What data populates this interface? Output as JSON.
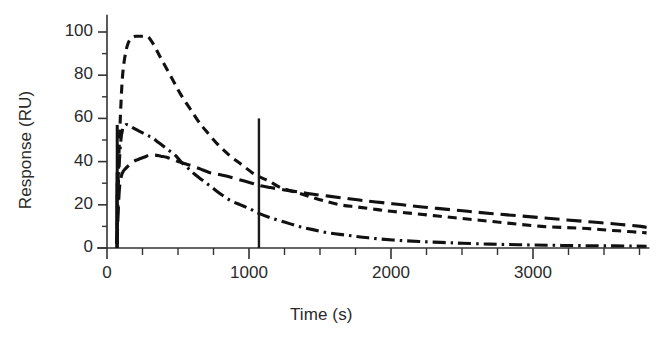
{
  "chart_data": {
    "type": "line",
    "title": "",
    "subtitle": "",
    "xlabel": "Time (s)",
    "ylabel": "Response (RU)",
    "xlim": [
      -60,
      3820
    ],
    "ylim": [
      -4,
      108
    ],
    "xticks": [
      0,
      1000,
      2000,
      3000
    ],
    "xtick_labels": [
      "0",
      "1000",
      "2000",
      "3000"
    ],
    "x_minor_tick_interval": 250,
    "yticks": [
      0,
      20,
      40,
      60,
      80,
      100
    ],
    "ytick_labels": [
      "0",
      "20",
      "40",
      "60",
      "80",
      "100"
    ],
    "y_minor_tick_interval": 10,
    "grid": false,
    "legend": "none",
    "axis_color": "#333333",
    "series": [
      {
        "name": "curve-high",
        "style": "dashed",
        "color": "#111111",
        "peak_value": 98,
        "x": [
          70,
          80,
          95,
          110,
          130,
          150,
          170,
          200,
          240,
          280,
          300,
          330,
          370,
          420,
          470,
          520,
          580,
          640,
          700,
          780,
          860,
          940,
          1020,
          1070,
          1140,
          1220,
          1320,
          1420,
          1520,
          1640,
          1760,
          1880,
          2000,
          2150,
          2300,
          2450,
          2600,
          2750,
          2900,
          3060,
          3220,
          3380,
          3540,
          3700,
          3800
        ],
        "y": [
          2,
          35,
          62,
          80,
          90,
          95,
          97,
          98,
          98,
          98,
          97,
          94,
          89,
          83,
          77,
          71,
          65,
          59,
          54,
          48,
          43,
          39,
          35,
          33,
          31,
          28,
          26,
          24,
          22,
          20,
          19,
          18,
          17,
          16,
          15,
          14,
          13,
          12,
          11,
          10,
          9.5,
          9,
          8.2,
          7.5,
          7
        ]
      },
      {
        "name": "curve-mid",
        "style": "dashdot",
        "color": "#111111",
        "peak_value": 57,
        "x": [
          70,
          80,
          95,
          110,
          130,
          150,
          175,
          200,
          230,
          260,
          290,
          320,
          360,
          400,
          440,
          480,
          520,
          570,
          620,
          680,
          740,
          800,
          870,
          940,
          1010,
          1070,
          1150,
          1250,
          1350,
          1450,
          1560,
          1680,
          1800,
          1920,
          2060,
          2200,
          2350,
          2500,
          2700,
          2900,
          3100,
          3300,
          3500,
          3700,
          3800
        ],
        "y": [
          2,
          30,
          48,
          55,
          57,
          57,
          56,
          55,
          54,
          53,
          52,
          51,
          49,
          47,
          45,
          43,
          40,
          37,
          34,
          31,
          28,
          25,
          22,
          20,
          18,
          16,
          14,
          12,
          10,
          8.5,
          7,
          6,
          5,
          4.2,
          3.5,
          3,
          2.6,
          2.2,
          1.8,
          1.5,
          1.3,
          1.1,
          1.0,
          0.9,
          0.8
        ]
      },
      {
        "name": "curve-low",
        "style": "longdash",
        "color": "#111111",
        "peak_value": 43,
        "x": [
          70,
          85,
          100,
          120,
          150,
          185,
          220,
          260,
          300,
          340,
          380,
          420,
          460,
          500,
          550,
          600,
          660,
          720,
          790,
          860,
          940,
          1020,
          1070,
          1150,
          1240,
          1340,
          1440,
          1560,
          1680,
          1800,
          1940,
          2080,
          2220,
          2380,
          2540,
          2700,
          2880,
          3060,
          3240,
          3420,
          3600,
          3760,
          3800
        ],
        "y": [
          2,
          25,
          33,
          36,
          38,
          40,
          41,
          42,
          43,
          43,
          42.5,
          42,
          41,
          40,
          39,
          38,
          36.5,
          35,
          34,
          33,
          31.5,
          30,
          29,
          28,
          27,
          26,
          25,
          24,
          23,
          22,
          21,
          20,
          19,
          18,
          17,
          16,
          15,
          14,
          13,
          12,
          11,
          10,
          9.5
        ]
      }
    ],
    "annotations": [
      {
        "name": "injection-stop-marker",
        "type": "vertical-line",
        "x": 1070,
        "y_from": 0,
        "y_to": 60,
        "color": "#1a1a1a"
      }
    ]
  }
}
